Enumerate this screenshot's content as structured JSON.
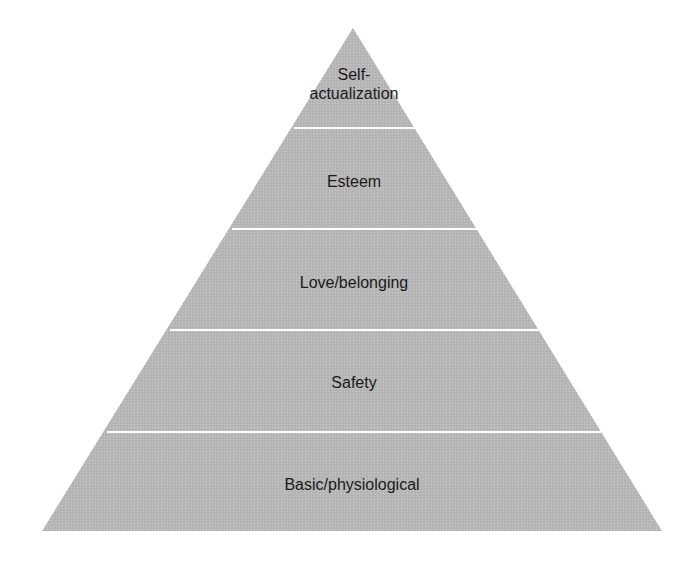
{
  "diagram": {
    "type": "pyramid",
    "fill_color": "#b7b7b7",
    "divider_color": "#ffffff",
    "levels_top_to_bottom": [
      {
        "label": "Self-\nactualization"
      },
      {
        "label": "Esteem"
      },
      {
        "label": "Love/belonging"
      },
      {
        "label": "Safety"
      },
      {
        "label": "Basic/physiological"
      }
    ]
  }
}
